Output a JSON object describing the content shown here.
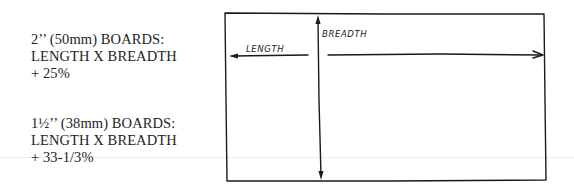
{
  "notes": [
    {
      "line1": "2’’ (50mm) BOARDS:",
      "line2": "LENGTH X BREADTH",
      "line3": "+ 25%"
    },
    {
      "line1": "1½’’ (38mm) BOARDS:",
      "line2": "LENGTH X BREADTH",
      "line3": "+ 33-1/3%"
    }
  ],
  "diagram": {
    "length_label": "LENGTH",
    "breadth_label": "BREADTH",
    "stroke_color": "#1a1a1a"
  }
}
